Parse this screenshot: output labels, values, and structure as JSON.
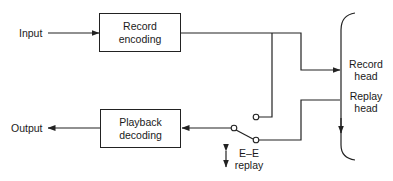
{
  "diagram": {
    "title": "",
    "nodes": {
      "input": {
        "label": "Input"
      },
      "output": {
        "label": "Output"
      },
      "record_encoding": {
        "line1": "Record",
        "line2": "encoding"
      },
      "playback_decoding": {
        "line1": "Playback",
        "line2": "decoding"
      },
      "record_head": {
        "line1": "Record",
        "line2": "head"
      },
      "replay_head": {
        "line1": "Replay",
        "line2": "head"
      },
      "switch": {
        "line1": "E–E",
        "line2": "replay"
      }
    },
    "edges": [
      {
        "from": "Input",
        "to": "Record encoding"
      },
      {
        "from": "Record encoding",
        "to": "Record head"
      },
      {
        "from": "Record encoding",
        "to": "Switch (E–E contact)"
      },
      {
        "from": "Replay head",
        "to": "Switch (replay contact)"
      },
      {
        "from": "Switch",
        "to": "Playback decoding"
      },
      {
        "from": "Playback decoding",
        "to": "Output"
      }
    ],
    "colors": {
      "line": "#222222",
      "background": "#ffffff"
    }
  }
}
